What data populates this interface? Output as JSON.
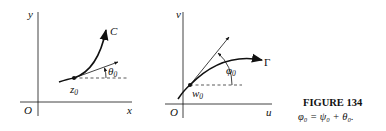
{
  "left_panel": {
    "axis_x_label": "x",
    "axis_y_label": "y",
    "origin_label": "O",
    "curve_label": "C",
    "point_label": "z",
    "point_sub": "0",
    "angle_label": "θ",
    "angle_sub": "0"
  },
  "right_panel": {
    "axis_x_label": "u",
    "axis_y_label": "v",
    "origin_label": "O",
    "curve_label": "Γ",
    "point_label": "w",
    "point_sub": "0",
    "angle_label": "φ",
    "angle_sub": "0"
  },
  "caption": {
    "title": "FIGURE 134",
    "equation": "φ₀ = ψ₀ + θ₀."
  },
  "colors": {
    "ink": "#111111"
  }
}
